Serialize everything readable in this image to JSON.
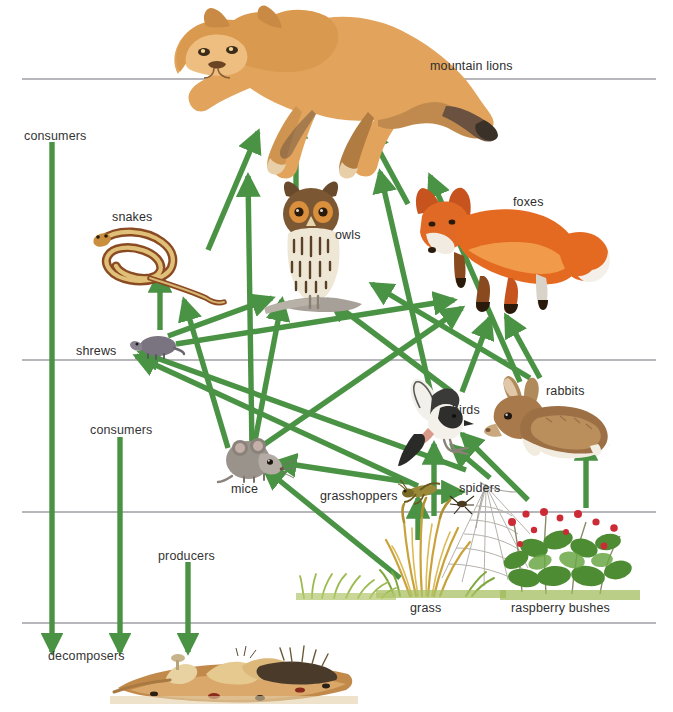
{
  "diagram": {
    "width": 673,
    "height": 712,
    "arrow_color": "#4a9244",
    "rule_color": "#6f6f78",
    "text_color": "#2b2b2b"
  },
  "tier_labels": [
    {
      "key": "consumers_top",
      "text": "consumers",
      "x": 24,
      "y": 130
    },
    {
      "key": "consumers_mid",
      "text": "consumers",
      "x": 90,
      "y": 424
    },
    {
      "key": "producers",
      "text": "producers",
      "x": 158,
      "y": 550
    },
    {
      "key": "decomposers",
      "text": "decomposers",
      "x": 48,
      "y": 650
    }
  ],
  "organisms": [
    {
      "key": "mountain_lions",
      "label": "mountain lions",
      "label_x": 430,
      "label_y": 60,
      "trophic": "tertiary consumer"
    },
    {
      "key": "snakes",
      "label": "snakes",
      "label_x": 112,
      "label_y": 211,
      "trophic": "secondary consumer"
    },
    {
      "key": "owls",
      "label": "owls",
      "label_x": 335,
      "label_y": 229,
      "trophic": "secondary consumer"
    },
    {
      "key": "foxes",
      "label": "foxes",
      "label_x": 513,
      "label_y": 196,
      "trophic": "secondary consumer"
    },
    {
      "key": "shrews",
      "label": "shrews",
      "label_x": 76,
      "label_y": 345,
      "trophic": "secondary consumer"
    },
    {
      "key": "birds",
      "label": "birds",
      "label_x": 452,
      "label_y": 404,
      "trophic": "secondary consumer"
    },
    {
      "key": "rabbits",
      "label": "rabbits",
      "label_x": 546,
      "label_y": 385,
      "trophic": "primary consumer"
    },
    {
      "key": "mice",
      "label": "mice",
      "label_x": 231,
      "label_y": 483,
      "trophic": "primary consumer"
    },
    {
      "key": "grasshoppers",
      "label": "grasshoppers",
      "label_x": 320,
      "label_y": 490,
      "trophic": "primary consumer"
    },
    {
      "key": "spiders",
      "label": "spiders",
      "label_x": 459,
      "label_y": 482,
      "trophic": "secondary consumer"
    },
    {
      "key": "grass",
      "label": "grass",
      "label_x": 410,
      "label_y": 602,
      "trophic": "producer"
    },
    {
      "key": "raspberry_bushes",
      "label": "raspberry bushes",
      "label_x": 511,
      "label_y": 602,
      "trophic": "producer"
    }
  ],
  "tier_rules": [
    {
      "key": "rule-consumers-top",
      "x1": 22,
      "y1": 79,
      "x2": 656,
      "y2": 79
    },
    {
      "key": "rule-consumers-mid",
      "x1": 22,
      "y1": 360,
      "x2": 656,
      "y2": 360
    },
    {
      "key": "rule-producers",
      "x1": 22,
      "y1": 512,
      "x2": 656,
      "y2": 512
    },
    {
      "key": "rule-decomposers",
      "x1": 22,
      "y1": 623,
      "x2": 656,
      "y2": 623
    }
  ],
  "tier_arrows": [
    {
      "key": "consumers-top-to-decomposers",
      "x1": 52,
      "y1": 142,
      "x2": 52,
      "y2": 652
    },
    {
      "key": "consumers-mid-to-decomposers",
      "x1": 120,
      "y1": 437,
      "x2": 120,
      "y2": 652
    },
    {
      "key": "producers-to-decomposers",
      "x1": 188,
      "y1": 562,
      "x2": 188,
      "y2": 652
    }
  ],
  "feeding_arrows": [
    {
      "from": "snakes",
      "to": "mountain_lions",
      "x1": 208,
      "y1": 250,
      "x2": 258,
      "y2": 132
    },
    {
      "from": "owls",
      "to": "mountain_lions",
      "x1": 296,
      "y1": 190,
      "x2": 296,
      "y2": 118
    },
    {
      "from": "foxes",
      "to": "mountain_lions",
      "x1": 408,
      "y1": 204,
      "x2": 368,
      "y2": 130
    },
    {
      "from": "rabbits",
      "to": "mountain_lions",
      "x1": 520,
      "y1": 382,
      "x2": 430,
      "y2": 176
    },
    {
      "from": "mice",
      "to": "mountain_lions",
      "x1": 252,
      "y1": 450,
      "x2": 248,
      "y2": 176
    },
    {
      "from": "birds",
      "to": "mountain_lions",
      "x1": 432,
      "y1": 398,
      "x2": 380,
      "y2": 172
    },
    {
      "from": "shrews",
      "to": "snakes",
      "x1": 160,
      "y1": 330,
      "x2": 160,
      "y2": 272
    },
    {
      "from": "mice",
      "to": "snakes",
      "x1": 228,
      "y1": 448,
      "x2": 184,
      "y2": 300
    },
    {
      "from": "shrews",
      "to": "owls",
      "x1": 168,
      "y1": 336,
      "x2": 272,
      "y2": 298
    },
    {
      "from": "mice",
      "to": "owls",
      "x1": 254,
      "y1": 446,
      "x2": 282,
      "y2": 300
    },
    {
      "from": "birds",
      "to": "owls",
      "x1": 452,
      "y1": 392,
      "x2": 330,
      "y2": 300
    },
    {
      "from": "rabbits",
      "to": "owls",
      "x1": 530,
      "y1": 378,
      "x2": 372,
      "y2": 284
    },
    {
      "from": "shrews",
      "to": "foxes",
      "x1": 176,
      "y1": 344,
      "x2": 454,
      "y2": 300
    },
    {
      "from": "mice",
      "to": "foxes",
      "x1": 262,
      "y1": 446,
      "x2": 462,
      "y2": 308
    },
    {
      "from": "birds",
      "to": "foxes",
      "x1": 462,
      "y1": 392,
      "x2": 490,
      "y2": 318
    },
    {
      "from": "rabbits",
      "to": "foxes",
      "x1": 540,
      "y1": 378,
      "x2": 506,
      "y2": 316
    },
    {
      "from": "grasshoppers",
      "to": "shrews",
      "x1": 418,
      "y1": 486,
      "x2": 136,
      "y2": 356
    },
    {
      "from": "spiders",
      "to": "shrews",
      "x1": 466,
      "y1": 470,
      "x2": 140,
      "y2": 352
    },
    {
      "from": "grasshoppers",
      "to": "mice",
      "x1": 408,
      "y1": 482,
      "x2": 276,
      "y2": 462
    },
    {
      "from": "grass",
      "to": "mice",
      "x1": 400,
      "y1": 578,
      "x2": 264,
      "y2": 468
    },
    {
      "from": "grass",
      "to": "grasshoppers",
      "x1": 418,
      "y1": 540,
      "x2": 418,
      "y2": 498
    },
    {
      "from": "grass",
      "to": "birds",
      "x1": 434,
      "y1": 516,
      "x2": 434,
      "y2": 444
    },
    {
      "from": "grasshoppers",
      "to": "spiders",
      "x1": 418,
      "y1": 492,
      "x2": 462,
      "y2": 492
    },
    {
      "from": "spiders",
      "to": "birds",
      "x1": 490,
      "y1": 478,
      "x2": 452,
      "y2": 446
    },
    {
      "from": "raspberry_bushes",
      "to": "rabbits",
      "x1": 586,
      "y1": 508,
      "x2": 586,
      "y2": 440
    },
    {
      "from": "raspberry_bushes",
      "to": "birds",
      "x1": 528,
      "y1": 500,
      "x2": 462,
      "y2": 434
    }
  ]
}
